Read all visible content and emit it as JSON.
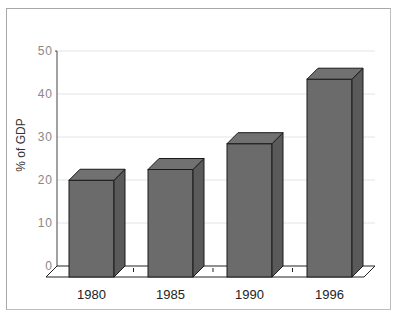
{
  "chart_data": {
    "type": "bar",
    "style": "3d-column",
    "title": "",
    "xlabel": "",
    "ylabel": "% of GDP",
    "categories": [
      "1980",
      "1985",
      "1990",
      "1996"
    ],
    "values": [
      22.5,
      25,
      31,
      46
    ],
    "ylim": [
      0,
      50
    ],
    "yticks": [
      "0",
      "10",
      "20",
      "30",
      "40",
      "50"
    ],
    "grid": true,
    "legend": "none",
    "colors": {
      "bar_front": "#6b6b6b",
      "bar_side": "#5a5a5a",
      "bar_top": "#717171",
      "gridline": "#e4e4e4",
      "axis": "#444444",
      "frame": "#a8a8a8"
    }
  }
}
